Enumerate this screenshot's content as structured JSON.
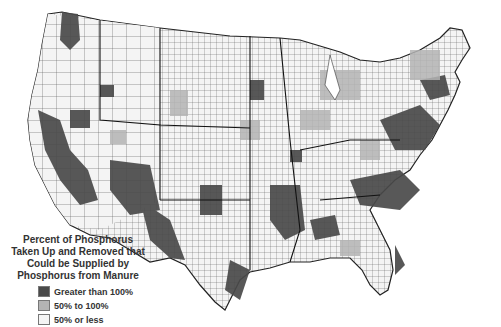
{
  "map": {
    "type": "choropleth",
    "region": "Contiguous United States (counties)",
    "colors": {
      "high": "#4a4a4a",
      "mid": "#b4b4b4",
      "low": "#f4f4f4",
      "border": "#333333"
    }
  },
  "legend": {
    "title_lines": [
      "Percent of Phosphorus",
      "Taken Up and Removed that",
      "Could be Supplied by",
      "Phosphorus from Manure"
    ],
    "items": [
      {
        "label": "Greater than 100%",
        "color": "#4a4a4a"
      },
      {
        "label": "50% to 100%",
        "color": "#b4b4b4"
      },
      {
        "label": "50% or less",
        "color": "#f4f4f4"
      }
    ]
  }
}
